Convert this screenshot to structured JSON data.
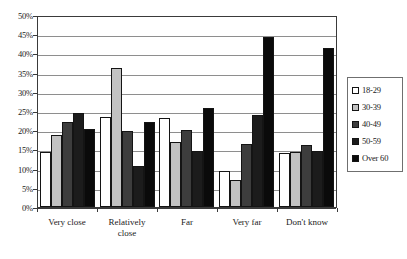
{
  "chart_data": {
    "type": "bar",
    "title": "",
    "subtitle": "",
    "xlabel": "",
    "ylabel": "",
    "ylim": [
      0,
      50
    ],
    "y_unit": "%",
    "grid": true,
    "legend_position": "right",
    "categories": [
      "Very close",
      "Relatively\nclose",
      "Far",
      "Very far",
      "Don't know"
    ],
    "y_ticks": [
      "0%",
      "5%",
      "10%",
      "15%",
      "20%",
      "25%",
      "30%",
      "35%",
      "40%",
      "45%",
      "50%"
    ],
    "y_tick_values": [
      0,
      5,
      10,
      15,
      20,
      25,
      30,
      35,
      40,
      45,
      50
    ],
    "series": [
      {
        "name": "18-29",
        "color": "#ffffff",
        "values": [
          14.2,
          23.5,
          23.3,
          9.4,
          14.0
        ]
      },
      {
        "name": "30-39",
        "color": "#c2c2c2",
        "values": [
          18.8,
          36.1,
          17.0,
          7.0,
          14.4
        ]
      },
      {
        "name": "40-49",
        "color": "#3d3d3d",
        "values": [
          22.2,
          19.9,
          20.1,
          16.3,
          16.1
        ]
      },
      {
        "name": "50-59",
        "color": "#1c1c1c",
        "values": [
          24.5,
          10.6,
          14.5,
          24.0,
          14.5
        ]
      },
      {
        "name": "Over 60",
        "color": "#0a0a0a",
        "values": [
          20.4,
          22.2,
          25.8,
          44.2,
          41.5
        ]
      }
    ]
  }
}
